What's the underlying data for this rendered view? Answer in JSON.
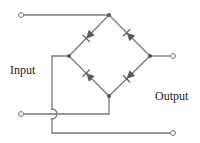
{
  "diagram": {
    "type": "full-wave bridge rectifier",
    "labels": {
      "input": "Input",
      "output": "Output"
    },
    "colors": {
      "wire": "#7a7a7a",
      "diode": "#5a5a5a",
      "node": "#555555",
      "text": "#222222"
    },
    "nodes": {
      "top": [
        109,
        15
      ],
      "left": [
        69,
        56
      ],
      "right": [
        150,
        56
      ],
      "bottom": [
        109,
        96
      ]
    },
    "terminals": [
      {
        "name": "input-top",
        "pos": [
          21,
          15
        ]
      },
      {
        "name": "input-bottom",
        "pos": [
          21,
          114
        ]
      },
      {
        "name": "output-top",
        "pos": [
          173,
          56
        ]
      },
      {
        "name": "output-bottom",
        "pos": [
          173,
          133
        ]
      }
    ],
    "diodes": [
      {
        "name": "diode-top-left",
        "from": "top",
        "to": "left",
        "direction": "points toward left node"
      },
      {
        "name": "diode-top-right",
        "from": "right",
        "to": "top",
        "direction": "points toward top node"
      },
      {
        "name": "diode-bottom-left",
        "from": "bottom",
        "to": "left",
        "direction": "points toward left node"
      },
      {
        "name": "diode-bottom-right",
        "from": "right",
        "to": "bottom",
        "direction": "points toward bottom node"
      }
    ],
    "crossover": {
      "name": "wire-hop",
      "pos": [
        52,
        114
      ]
    }
  }
}
